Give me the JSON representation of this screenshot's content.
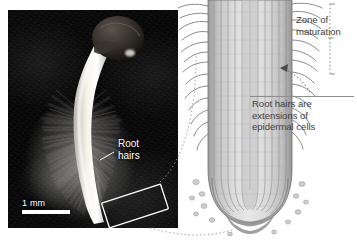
{
  "figure": {
    "type": "biology-figure",
    "panels": [
      "photograph",
      "line-diagram"
    ]
  },
  "photo": {
    "scale_bar": {
      "label": "1 mm",
      "length_px": 48
    },
    "labels": {
      "root_hairs": "Root\nhairs",
      "root_hairs_line1": "Root",
      "root_hairs_line2": "hairs"
    },
    "highlight_box": {
      "present": true,
      "description": "tilted white rectangle around root tip"
    },
    "specimen": "germinating seedling with seed coat, hypocotyl and root covered in root hairs"
  },
  "diagram": {
    "zone_label_line1": "Zone of",
    "zone_label_line2": "maturation",
    "note_line1": "Root hairs are",
    "note_line2": "extensions of",
    "note_line3": "epidermal cells",
    "bracket": {
      "present": true,
      "spans": "root hair zone"
    },
    "arrow": {
      "present": true,
      "points_to": "epidermal cell file"
    },
    "structures": [
      "root hairs",
      "epidermal cells",
      "cortex",
      "root cap",
      "sloughed cells"
    ]
  },
  "colors": {
    "photo_background": "#050505",
    "photo_text": "#ffffff",
    "diagram_ink": "#6e6e6e",
    "diagram_fill": "#c8c8c8",
    "label_text": "#3d3d3d",
    "connector": "#8d8d8d",
    "page_background": "#ffffff"
  }
}
